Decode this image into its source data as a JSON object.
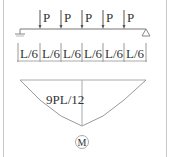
{
  "diagram": {
    "loads": [
      {
        "label": "P",
        "x": 40
      },
      {
        "label": "P",
        "x": 61
      },
      {
        "label": "P",
        "x": 82
      },
      {
        "label": "P",
        "x": 103
      },
      {
        "label": "P",
        "x": 124
      }
    ],
    "segments": [
      {
        "label": "L/6"
      },
      {
        "label": "L/6"
      },
      {
        "label": "L/6"
      },
      {
        "label": "L/6"
      },
      {
        "label": "L/6"
      },
      {
        "label": "L/6"
      }
    ],
    "moment_label": "9PL/12",
    "diagram_tag": "M",
    "colors": {
      "line": "#555555",
      "light_line": "#aaaaaa",
      "text": "#333333",
      "frame": "#c8c8c8"
    }
  }
}
